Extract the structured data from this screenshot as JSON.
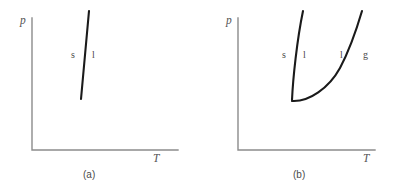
{
  "figure": {
    "type": "phase-diagram-pair",
    "background": "#ffffff",
    "axis_color": "#8c8c8c",
    "curve_color": "#1a1a1a",
    "label_color": "#4a4a4a"
  },
  "panels": [
    {
      "id": "a",
      "caption": "(a)",
      "axes": {
        "y_label": "p",
        "x_label": "T",
        "origin": {
          "x": 32,
          "y": 150
        },
        "y_top": {
          "x": 32,
          "y": 18
        },
        "x_right": {
          "x": 178,
          "y": 150
        }
      },
      "curves": [
        {
          "name": "solid-liquid-boundary",
          "kind": "line",
          "points": [
            {
              "x": 89,
              "y": 11
            },
            {
              "x": 81,
              "y": 99
            }
          ]
        }
      ],
      "phase_labels": [
        {
          "text": "s",
          "x": 71,
          "y": 50
        },
        {
          "text": "l",
          "x": 92,
          "y": 50
        }
      ]
    },
    {
      "id": "b",
      "caption": "(b)",
      "axes": {
        "y_label": "p",
        "x_label": "T",
        "origin": {
          "x": 41,
          "y": 150
        },
        "y_top": {
          "x": 41,
          "y": 18
        },
        "x_right": {
          "x": 178,
          "y": 150
        }
      },
      "curves": [
        {
          "name": "solid-liquid-boundary",
          "kind": "curve",
          "points": [
            {
              "x": 95,
              "y": 100
            },
            {
              "x": 99,
              "y": 50
            },
            {
              "x": 106,
              "y": 11
            }
          ]
        },
        {
          "name": "liquid-gas-boundary",
          "kind": "curve",
          "points": [
            {
              "x": 95,
              "y": 101
            },
            {
              "x": 126,
              "y": 93
            },
            {
              "x": 149,
              "y": 60
            },
            {
              "x": 165,
              "y": 11
            }
          ]
        }
      ],
      "triple_point": {
        "x": 95,
        "y": 100
      },
      "phase_labels": [
        {
          "text": "s",
          "x": 86,
          "y": 50
        },
        {
          "text": "l",
          "x": 106,
          "y": 50
        },
        {
          "text": "l",
          "x": 143,
          "y": 50
        },
        {
          "text": "g",
          "x": 166,
          "y": 50
        }
      ]
    }
  ],
  "axis_labels": {
    "pressure": "p",
    "temperature": "T"
  },
  "phase_names": {
    "s": "solid",
    "l": "liquid",
    "g": "gas"
  }
}
